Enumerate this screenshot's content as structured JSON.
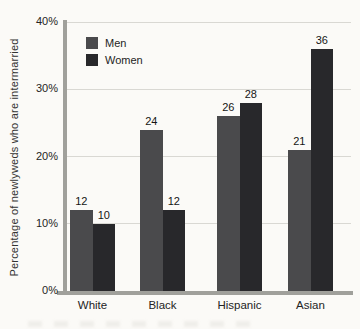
{
  "chart_data": {
    "type": "bar",
    "categories": [
      "White",
      "Black",
      "Hispanic",
      "Asian"
    ],
    "series": [
      {
        "name": "Men",
        "values": [
          12,
          24,
          26,
          21
        ],
        "color": "#4a4a4c"
      },
      {
        "name": "Women",
        "values": [
          10,
          12,
          28,
          36
        ],
        "color": "#28282b"
      }
    ],
    "title": "",
    "xlabel": "",
    "ylabel": "Percentage of newlyweds who are intermarried",
    "ylim": [
      0,
      40
    ],
    "yticks": [
      0,
      10,
      20,
      30,
      40
    ],
    "ytick_labels": [
      "0%",
      "10%",
      "20%",
      "30%",
      "40%"
    ],
    "grid": true,
    "legend_position": "top-left",
    "value_labels": true
  },
  "colors": {
    "axis": "#a0a09b",
    "gridline": "#d9d8d3",
    "background": "#fbfaf7"
  }
}
